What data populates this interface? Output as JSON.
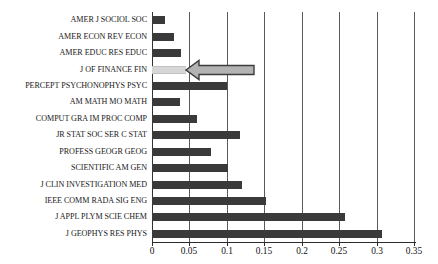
{
  "chart_data": {
    "type": "bar",
    "orientation": "horizontal",
    "title": "",
    "subtitle": "",
    "xlabel": "",
    "ylabel": "",
    "xlim": [
      0,
      0.35
    ],
    "ylim": null,
    "grid": true,
    "grid_axis": "x",
    "legend": null,
    "legend_position": "none",
    "tick_labels": [
      "0",
      "0.05",
      "0.1",
      "0.15",
      "0.2",
      "0.25",
      "0.3",
      "0.35"
    ],
    "tick_values": [
      0,
      0.05,
      0.1,
      0.15,
      0.2,
      0.25,
      0.3,
      0.35
    ],
    "categories": [
      "AMER J SOCIOL  SOC",
      "AMER ECON REV ECON",
      "AMER EDUC RES EDUC",
      "J OF FINANCE  FIN",
      "PERCEPT PSYCHONOPHYS  PSYC",
      "AM MATH MO  MATH",
      "COMPUT GRA IM PROC  COMP",
      "JR STAT SOC SER C  STAT",
      "PROFESS GEOGR GEOG",
      "SCIENTIFIC AM   GEN",
      "J CLIN INVESTIGATION  MED",
      "IEEE COMM RADA SIG   ENG",
      "J APPL PLYM SCIE CHEM",
      "J GEOPHYS RES PHYS"
    ],
    "values": [
      0.018,
      0.029,
      0.039,
      0.045,
      0.1,
      0.037,
      0.06,
      0.118,
      0.079,
      0.101,
      0.12,
      0.152,
      0.258,
      0.307
    ],
    "highlight_index": 3,
    "annotations": [
      {
        "name": "pointer-arrow",
        "shape": "left-arrow",
        "points_to_category": "J OF FINANCE  FIN"
      }
    ]
  },
  "colors": {
    "bar": "#3a3a3a",
    "bar_highlight": "#d6d6d6",
    "grid": "#5a5a5a",
    "axis": "#2b2b2b",
    "arrow_fill": "#b3b3b3",
    "arrow_stroke": "#3d3d3d",
    "background": "#ffffff"
  }
}
